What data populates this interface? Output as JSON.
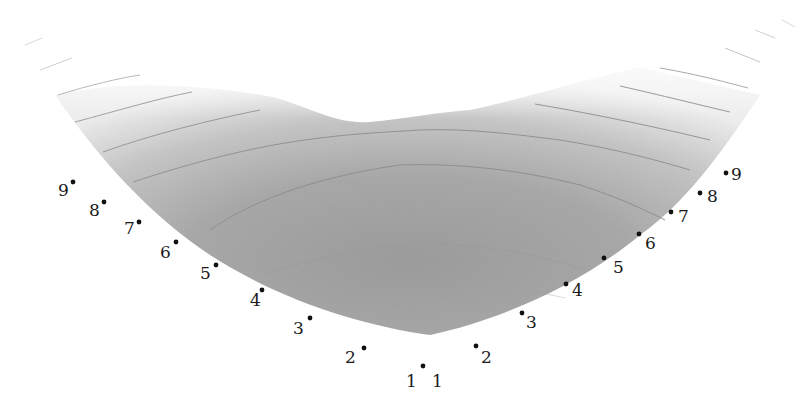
{
  "diagram": {
    "type": "shaded-contour-surface",
    "colors": {
      "background": "#ffffff",
      "surface_dark": "#9a9a9a",
      "surface_mid": "#b0b0b0",
      "surface_light": "#e6e6e6",
      "contour_line": "#8a8a8a",
      "point": "#111111",
      "label": "#1a1a1a"
    },
    "left_points": [
      {
        "label": "9",
        "dot": [
          73,
          182
        ],
        "text": [
          58,
          196
        ]
      },
      {
        "label": "8",
        "dot": [
          104,
          202
        ],
        "text": [
          89,
          216
        ]
      },
      {
        "label": "7",
        "dot": [
          139,
          222
        ],
        "text": [
          124,
          234
        ]
      },
      {
        "label": "6",
        "dot": [
          176,
          242
        ],
        "text": [
          160,
          258
        ]
      },
      {
        "label": "5",
        "dot": [
          216,
          265
        ],
        "text": [
          200,
          279
        ]
      },
      {
        "label": "4",
        "dot": [
          262,
          290
        ],
        "text": [
          250,
          306
        ]
      },
      {
        "label": "3",
        "dot": [
          310,
          318
        ],
        "text": [
          293,
          334
        ]
      },
      {
        "label": "2",
        "dot": [
          364,
          348
        ],
        "text": [
          345,
          363
        ]
      },
      {
        "label": "1",
        "dot": [
          423,
          366
        ],
        "text": [
          406,
          387
        ]
      }
    ],
    "right_points": [
      {
        "label": "1",
        "dot": null,
        "text": [
          432,
          387
        ]
      },
      {
        "label": "2",
        "dot": [
          476,
          346
        ],
        "text": [
          481,
          363
        ]
      },
      {
        "label": "3",
        "dot": [
          522,
          313
        ],
        "text": [
          526,
          328
        ]
      },
      {
        "label": "4",
        "dot": [
          566,
          284
        ],
        "text": [
          572,
          296
        ]
      },
      {
        "label": "5",
        "dot": [
          604,
          258
        ],
        "text": [
          613,
          273
        ]
      },
      {
        "label": "6",
        "dot": [
          639,
          234
        ],
        "text": [
          645,
          249
        ]
      },
      {
        "label": "7",
        "dot": [
          671,
          212
        ],
        "text": [
          678,
          222
        ]
      },
      {
        "label": "8",
        "dot": [
          700,
          193
        ],
        "text": [
          707,
          202
        ]
      },
      {
        "label": "9",
        "dot": [
          726,
          173
        ],
        "text": [
          731,
          180
        ]
      }
    ]
  }
}
